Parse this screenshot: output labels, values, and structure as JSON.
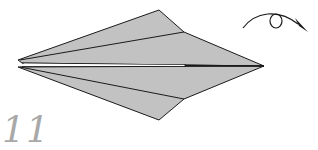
{
  "diagram": {
    "step_number": "11",
    "paper_fill": "#c2c2c2",
    "line_color": "#1a1a1a",
    "step_color": "#a8a8a8",
    "symbol": "turn-over-arrow",
    "upper_flap": [
      [
        18,
        60
      ],
      [
        159,
        10
      ],
      [
        184,
        32
      ],
      [
        264,
        66
      ],
      [
        20,
        63
      ]
    ],
    "lower_flap": [
      [
        18,
        67
      ],
      [
        264,
        66
      ],
      [
        184,
        99
      ],
      [
        159,
        120
      ]
    ],
    "upper_crease": [
      [
        20,
        60
      ],
      [
        184,
        32
      ]
    ],
    "lower_crease": [
      [
        20,
        67
      ],
      [
        184,
        99
      ]
    ],
    "center_line": [
      [
        22,
        64
      ],
      [
        264,
        66
      ]
    ]
  }
}
